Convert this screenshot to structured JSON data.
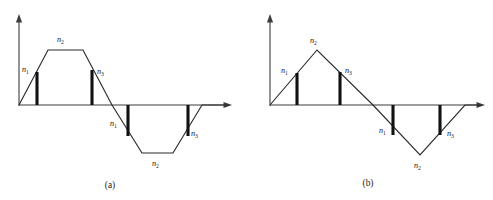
{
  "figure": {
    "background_color": "#ffffff",
    "line_color": "#2b2b2b",
    "axis_color": "#3c3c3c",
    "impulse_color": "#111111",
    "panels": [
      {
        "id": "panel-a",
        "caption": "(a)",
        "caption_pos": {
          "x": 110,
          "y": 188
        },
        "origin": {
          "x": 19,
          "y": 105
        },
        "y_axis": {
          "x": 19,
          "y_top": 16,
          "y_bottom": 106
        },
        "x_axis": {
          "y": 105,
          "x_left": 19,
          "x_right": 232
        },
        "waveform_points": [
          {
            "x": 19,
            "y": 105
          },
          {
            "x": 48,
            "y": 50
          },
          {
            "x": 83,
            "y": 50
          },
          {
            "x": 112,
            "y": 105
          },
          {
            "x": 142,
            "y": 153
          },
          {
            "x": 173,
            "y": 153
          },
          {
            "x": 202,
            "y": 105
          },
          {
            "x": 228,
            "y": 105
          }
        ],
        "impulses": [
          {
            "name": "impulse-a-1",
            "x": 37,
            "y_top": 72,
            "y_bottom": 105
          },
          {
            "name": "impulse-a-2",
            "x": 92,
            "y_top": 70,
            "y_bottom": 105
          },
          {
            "name": "impulse-a-3",
            "x": 128,
            "y_top": 105,
            "y_bottom": 136
          },
          {
            "name": "impulse-a-4",
            "x": 188,
            "y_top": 105,
            "y_bottom": 136
          }
        ],
        "labels": [
          {
            "name": "label-a-n1-top",
            "text": "n",
            "sub": "1",
            "x": 22,
            "y": 72
          },
          {
            "name": "label-a-n2-top",
            "text": "n",
            "sub": "2",
            "x": 57,
            "y": 42
          },
          {
            "name": "label-a-n3-top",
            "text": "n",
            "sub": "3",
            "x": 97,
            "y": 74
          },
          {
            "name": "label-a-n1-bottom",
            "text": "n",
            "sub": "1",
            "x": 110,
            "y": 126
          },
          {
            "name": "label-a-n2-bottom",
            "text": "n",
            "sub": "2",
            "x": 152,
            "y": 166
          },
          {
            "name": "label-a-n3-bottom",
            "text": "n",
            "sub": "3",
            "x": 191,
            "y": 136
          }
        ]
      },
      {
        "id": "panel-b",
        "caption": "(b)",
        "caption_pos": {
          "x": 368,
          "y": 186
        },
        "origin": {
          "x": 270,
          "y": 105
        },
        "y_axis": {
          "x": 270,
          "y_top": 16,
          "y_bottom": 106
        },
        "x_axis": {
          "y": 105,
          "x_left": 270,
          "x_right": 485
        },
        "waveform_points": [
          {
            "x": 270,
            "y": 105
          },
          {
            "x": 317,
            "y": 50
          },
          {
            "x": 373,
            "y": 105
          },
          {
            "x": 420,
            "y": 155
          },
          {
            "x": 465,
            "y": 105
          },
          {
            "x": 481,
            "y": 105
          }
        ],
        "impulses": [
          {
            "name": "impulse-b-1",
            "x": 297,
            "y_top": 73,
            "y_bottom": 105
          },
          {
            "name": "impulse-b-2",
            "x": 340,
            "y_top": 72,
            "y_bottom": 105
          },
          {
            "name": "impulse-b-3",
            "x": 393,
            "y_top": 105,
            "y_bottom": 135
          },
          {
            "name": "impulse-b-4",
            "x": 440,
            "y_top": 105,
            "y_bottom": 135
          }
        ],
        "labels": [
          {
            "name": "label-b-n1-top",
            "text": "n",
            "sub": "1",
            "x": 283,
            "y": 73
          },
          {
            "name": "label-b-n2-top",
            "text": "n",
            "sub": "2",
            "x": 312,
            "y": 43
          },
          {
            "name": "label-b-n3-top",
            "text": "n",
            "sub": "3",
            "x": 345,
            "y": 73
          },
          {
            "name": "label-b-n1-bottom",
            "text": "n",
            "sub": "1",
            "x": 381,
            "y": 133
          },
          {
            "name": "label-b-n2-bottom",
            "text": "n",
            "sub": "2",
            "x": 417,
            "y": 168
          },
          {
            "name": "label-b-n3-bottom",
            "text": "n",
            "sub": "3",
            "x": 447,
            "y": 136
          }
        ]
      }
    ]
  }
}
